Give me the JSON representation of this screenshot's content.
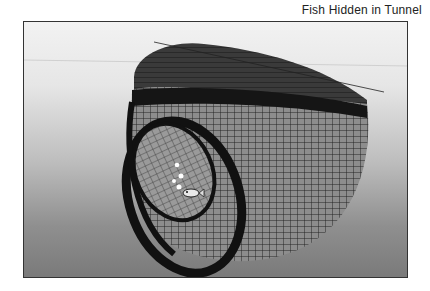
{
  "figure": {
    "caption": "Fish Hidden in Tunnel",
    "image_description": "Grayscale 3D wireframe render of a curved tunnel structure with a small fish and light points inside"
  },
  "colors": {
    "frame_border": "#333333",
    "background_top": "#f2f2f2",
    "background_bottom": "#7a7a7a",
    "wireframe": "#1a1a1a"
  }
}
